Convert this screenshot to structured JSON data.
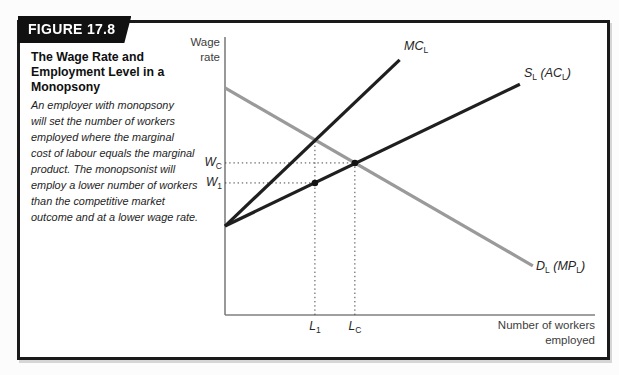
{
  "figure": {
    "tag": "FIGURE 17.8",
    "title": "The Wage Rate and\nEmployment Level in a\nMonopsony",
    "description": "An employer with monopsony\nwill set the number of workers\nemployed where the marginal\ncost of labour equals the marginal\nproduct. The monopsonist will\nemploy a lower number of workers\nthan the competitive market\noutcome and at a lower wage rate."
  },
  "labels": {
    "y_axis": "Wage\nrate",
    "x_axis": "Number of workers\nemployed",
    "mc": {
      "base": "MC",
      "sub": "L"
    },
    "s": {
      "base": "S",
      "sub": "L",
      "base2": " (AC",
      "sub2": "L",
      "base3": ")"
    },
    "d": {
      "base": "D",
      "sub": "L",
      "base2": " (MP",
      "sub2": "L",
      "base3": ")"
    },
    "wc": {
      "base": "W",
      "sub": "C"
    },
    "w1": {
      "base": "W",
      "sub": "1"
    },
    "l1": {
      "base": "L",
      "sub": "1"
    },
    "lc": {
      "base": "L",
      "sub": "C"
    }
  },
  "chart_data": {
    "type": "line",
    "title": "The Wage Rate and Employment Level in a Monopsony",
    "xlabel": "Number of workers employed",
    "ylabel": "Wage rate",
    "x_range": [
      0,
      10
    ],
    "y_range": [
      0,
      10
    ],
    "axes_numeric": false,
    "grid": false,
    "colors": {
      "axis": "#7f7f7f",
      "guide": "#474747",
      "point": "#131313"
    },
    "series": [
      {
        "name": "MC_L (marginal cost of labour)",
        "color": "#1f1f1f",
        "width": 3.2,
        "layer": 2,
        "points": [
          [
            0,
            3.2
          ],
          [
            4.72,
            9.18
          ]
        ]
      },
      {
        "name": "S_L (AC_L) (labour supply = average cost of labour)",
        "color": "#1f1f1f",
        "width": 3.2,
        "layer": 2,
        "points": [
          [
            0,
            3.2
          ],
          [
            7.97,
            8.3
          ]
        ]
      },
      {
        "name": "D_L (MP_L) (labour demand = marginal product)",
        "color": "#9a9a9a",
        "width": 3.2,
        "layer": 1,
        "points": [
          [
            0,
            8.17
          ],
          [
            8.32,
            1.77
          ]
        ]
      }
    ],
    "key_points": [
      {
        "label": "monopsony outcome (L_1, W_1) on S_L",
        "x": 2.43,
        "y": 4.75
      },
      {
        "label": "competitive equilibrium (L_C, W_C) where S_L = D_L",
        "x": 3.51,
        "y": 5.47
      }
    ],
    "guides": [
      {
        "type": "h",
        "at": 5.47,
        "from": 0,
        "to": 3.51,
        "label": "W_C"
      },
      {
        "type": "h",
        "at": 4.75,
        "from": 0,
        "to": 2.43,
        "label": "W_1"
      },
      {
        "type": "v",
        "at": 2.43,
        "from": 0,
        "to": 6.3,
        "label": "L_1"
      },
      {
        "type": "v",
        "at": 3.51,
        "from": 0,
        "to": 5.47,
        "label": "L_C"
      }
    ],
    "x_ticks": [
      {
        "label": "L_1",
        "x": 2.43
      },
      {
        "label": "L_C",
        "x": 3.51
      }
    ],
    "y_ticks": [
      {
        "label": "W_1",
        "y": 4.75
      },
      {
        "label": "W_C",
        "y": 5.47
      }
    ]
  }
}
